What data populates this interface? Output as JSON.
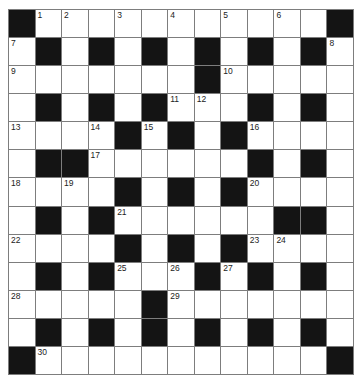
{
  "puzzle": {
    "rows": 13,
    "cols": 13,
    "colors": {
      "black": "#141414",
      "white": "#ffffff",
      "line": "#7d7d7d",
      "number": "#222222"
    },
    "layout": [
      "#1.2.3.4.5.6.#",
      ".#.#.#.#.#.#.",
      "........#....",
      ".#.#.#..#.#.#",
      "....#.#.#....",
      ".##......#.#.",
      "....#.#.#....",
      ".#.#......##.",
      "....#.#.#....",
      ".#.#...#.#.#.",
      ".....#.......",
      ".#.#.#.#.#.#.",
      "#...........#"
    ],
    "grid": [
      [
        "B",
        "1",
        "2",
        "",
        "3",
        "",
        "4",
        "",
        "5",
        "",
        "6",
        "",
        "B"
      ],
      [
        "7",
        "B",
        "",
        "B",
        "",
        "B",
        "",
        "B",
        "",
        "B",
        "",
        "B",
        "8"
      ],
      [
        "9",
        "",
        "",
        "",
        "",
        "",
        "",
        "B",
        "10",
        "",
        "",
        "",
        ""
      ],
      [
        "",
        "B",
        "",
        "B",
        "",
        "B",
        "11",
        "12",
        "",
        "B",
        "",
        "B",
        ""
      ],
      [
        "13",
        "",
        "",
        "14",
        "B",
        "15",
        "B",
        "",
        "B",
        "16",
        "",
        "",
        ""
      ],
      [
        "",
        "B",
        "B",
        "17",
        "",
        "",
        "",
        "",
        "",
        "B",
        "",
        "B",
        ""
      ],
      [
        "18",
        "",
        "19",
        "",
        "B",
        "",
        "B",
        "",
        "B",
        "20",
        "",
        "",
        ""
      ],
      [
        "",
        "B",
        "",
        "B",
        "21",
        "",
        "",
        "",
        "",
        "",
        "B",
        "B",
        ""
      ],
      [
        "22",
        "",
        "",
        "",
        "B",
        "",
        "B",
        "",
        "B",
        "23",
        "24",
        "",
        ""
      ],
      [
        "",
        "B",
        "",
        "B",
        "25",
        "",
        "26",
        "B",
        "27",
        "B",
        "",
        "B",
        ""
      ],
      [
        "28",
        "",
        "",
        "",
        "",
        "B",
        "29",
        "",
        "",
        "",
        "",
        "",
        ""
      ],
      [
        "",
        "B",
        "",
        "B",
        "",
        "B",
        "",
        "B",
        "",
        "B",
        "",
        "B",
        ""
      ],
      [
        "B",
        "30",
        "",
        "",
        "",
        "",
        "",
        "",
        "",
        "",
        "",
        "",
        "B"
      ]
    ],
    "clue_numbers": [
      "1",
      "2",
      "3",
      "4",
      "5",
      "6",
      "7",
      "8",
      "9",
      "10",
      "11",
      "12",
      "13",
      "14",
      "15",
      "16",
      "17",
      "18",
      "19",
      "20",
      "21",
      "22",
      "23",
      "24",
      "25",
      "26",
      "27",
      "28",
      "29",
      "30"
    ]
  }
}
